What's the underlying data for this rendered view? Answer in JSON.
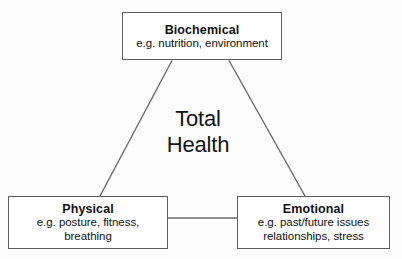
{
  "diagram": {
    "type": "triangle-concept-diagram",
    "center_label": "Total\nHealth",
    "colors": {
      "background": "#fdfdfd",
      "box_fill": "#ffffff",
      "box_border": "#5c5c5c",
      "connector_line": "#6a6a6a",
      "text": "#111111"
    },
    "nodes": [
      {
        "id": "biochemical",
        "title": "Biochemical",
        "description": "e.g. nutrition, environment"
      },
      {
        "id": "physical",
        "title": "Physical",
        "description": "e.g. posture, fitness,\nbreathing"
      },
      {
        "id": "emotional",
        "title": "Emotional",
        "description": "e.g. past/future issues\nrelationships, stress"
      }
    ],
    "connectors": [
      {
        "id": "biochemical-to-physical",
        "kind": "diagonal"
      },
      {
        "id": "biochemical-to-emotional",
        "kind": "diagonal"
      },
      {
        "id": "physical-to-emotional",
        "kind": "horizontal"
      }
    ]
  }
}
